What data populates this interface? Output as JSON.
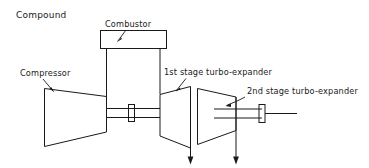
{
  "figure": {
    "title": "Compound",
    "background_color": "#ffffff",
    "line_color": "#1a1a1a"
  },
  "labels": {
    "title": "Compound",
    "combustor": "Combustor",
    "compressor": "Compressor",
    "stage1": "1st stage turbo-expander",
    "stage2": "2nd stage turbo-expander"
  },
  "components": [
    {
      "name": "compressor",
      "label": "Compressor",
      "shape": "trapezoid",
      "note": "inlet at left, discharge at right"
    },
    {
      "name": "combustor",
      "label": "Combustor",
      "shape": "rectangle",
      "note": "mounted above, two vertical ducts"
    },
    {
      "name": "stage1-turbo-expander",
      "label": "1st stage turbo-expander",
      "shape": "trapezoid",
      "note": "expands right, exhaust downward"
    },
    {
      "name": "stage2-turbo-expander",
      "label": "2nd stage turbo-expander",
      "shape": "trapezoid",
      "note": "expands left to right, exhaust downward"
    }
  ],
  "shafts": [
    {
      "name": "shaft-1",
      "note": "connects compressor and 1st stage turbo-expander with coupling"
    },
    {
      "name": "shaft-2",
      "note": "output shaft from 2nd stage turbo-expander with coupling"
    }
  ],
  "flow_arrows": [
    {
      "name": "exhaust-arrow-stage1",
      "direction": "down"
    },
    {
      "name": "exhaust-arrow-stage2",
      "direction": "down"
    }
  ]
}
